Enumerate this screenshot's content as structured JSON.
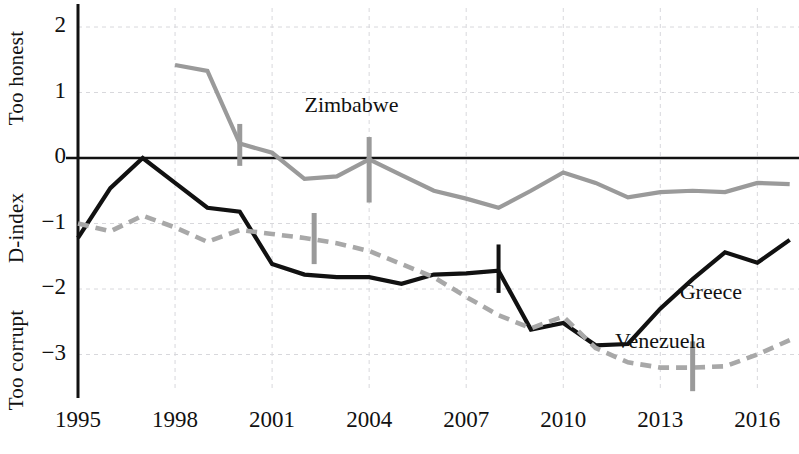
{
  "chart_data": {
    "type": "line",
    "title": "",
    "xlabel": "",
    "ylabel": "D-index",
    "ylabel_top": "Too honest",
    "ylabel_mid": "D-index",
    "ylabel_bottom": "Too corrupt",
    "xlim": [
      1995,
      2017.3
    ],
    "ylim": [
      -3.6,
      2.25
    ],
    "grid": true,
    "legend_position": "inline-annotations",
    "xticks": [
      1995,
      1998,
      2001,
      2004,
      2007,
      2010,
      2013,
      2016
    ],
    "xtick_labels": [
      "1995",
      "1998",
      "2001",
      "2004",
      "2007",
      "2010",
      "2013",
      "2016"
    ],
    "yticks": [
      2,
      1,
      0,
      -1,
      -2,
      -3
    ],
    "ytick_labels": [
      "2",
      "1",
      "0",
      "−1",
      "−2",
      "−3"
    ],
    "zero_line": 0,
    "series": [
      {
        "name": "Zimbabwe",
        "style": "solid",
        "color": "#9a9a9a",
        "label_x": 2002.0,
        "label_y": 0.78,
        "x": [
          1998,
          1999,
          2000,
          2001,
          2002,
          2003,
          2004,
          2005,
          2006,
          2007,
          2008,
          2009,
          2010,
          2011,
          2012,
          2013,
          2014,
          2015,
          2016,
          2017
        ],
        "y": [
          1.42,
          1.33,
          0.22,
          0.08,
          -0.32,
          -0.28,
          -0.02,
          -0.26,
          -0.5,
          -0.62,
          -0.76,
          -0.5,
          -0.22,
          -0.38,
          -0.6,
          -0.52,
          -0.5,
          -0.52,
          -0.38,
          -0.4
        ],
        "markers": [
          {
            "x": 2000.0,
            "y": 0.22,
            "low": 0.52,
            "high": -0.12
          },
          {
            "x": 2004.0,
            "y": -0.02,
            "low": 0.32,
            "high": -0.68
          }
        ]
      },
      {
        "name": "Greece",
        "style": "solid",
        "color": "#111111",
        "label_x": 2013.6,
        "label_y": -2.08,
        "x": [
          1995,
          1996,
          1997,
          1998,
          1999,
          2000,
          2001,
          2002,
          2003,
          2004,
          2005,
          2006,
          2007,
          2008,
          2009,
          2010,
          2011,
          2012,
          2013,
          2014,
          2015,
          2016,
          2017
        ],
        "y": [
          -1.22,
          -0.46,
          0.0,
          -0.38,
          -0.76,
          -0.82,
          -1.62,
          -1.78,
          -1.82,
          -1.82,
          -1.92,
          -1.78,
          -1.76,
          -1.72,
          -2.62,
          -2.52,
          -2.86,
          -2.84,
          -2.3,
          -1.85,
          -1.44,
          -1.6,
          -1.25
        ],
        "markers": [
          {
            "x": 2008.0,
            "y": -1.72,
            "low": -1.32,
            "high": -2.06
          }
        ]
      },
      {
        "name": "Venezuela",
        "style": "dashed",
        "color": "#a8a8a8",
        "label_x": 2011.6,
        "label_y": -2.82,
        "x": [
          1995,
          1996,
          1997,
          1998,
          1999,
          2000,
          2001,
          2002,
          2003,
          2004,
          2005,
          2006,
          2007,
          2008,
          2009,
          2010,
          2011,
          2012,
          2013,
          2014,
          2015,
          2016,
          2017
        ],
        "y": [
          -1.0,
          -1.12,
          -0.88,
          -1.06,
          -1.28,
          -1.1,
          -1.16,
          -1.22,
          -1.3,
          -1.42,
          -1.62,
          -1.82,
          -2.12,
          -2.4,
          -2.6,
          -2.42,
          -2.9,
          -3.12,
          -3.2,
          -3.2,
          -3.18,
          -3.0,
          -2.78
        ],
        "markers": [
          {
            "x": 2002.3,
            "y": -1.22,
            "low": -0.84,
            "high": -1.62
          },
          {
            "x": 2014.0,
            "y": -3.2,
            "low": -2.8,
            "high": -3.56
          }
        ]
      }
    ]
  }
}
